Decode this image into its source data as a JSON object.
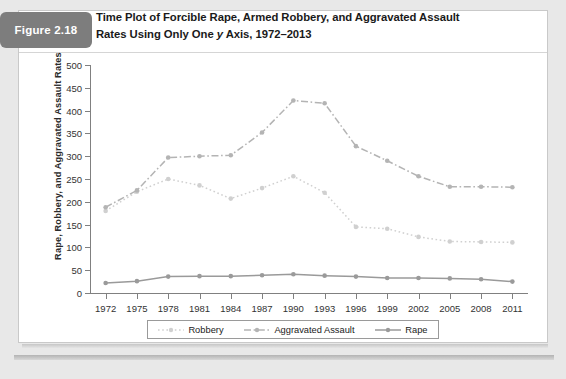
{
  "figure": {
    "badge_label": "Figure 2.18",
    "title_line1": "Time Plot of Forcible Rape, Armed Robbery, and Aggravated Assault",
    "title_line2_a": "Rates Using Only One ",
    "title_line2_italic": "y",
    "title_line2_b": " Axis, 1972–2013"
  },
  "colors": {
    "badge_bg": "#7d7d7d",
    "card_bg": "#ffffff",
    "page_bg": "#e8e8e8",
    "axis": "#808080",
    "robbery": "#d0d0d0",
    "aggravated_assault": "#b4b4b4",
    "rape": "#9a9a9a"
  },
  "chart_data": {
    "type": "line",
    "title": "Time Plot of Forcible Rape, Armed Robbery, and Aggravated Assault Rates Using Only One y Axis, 1972–2013",
    "xlabel": "",
    "ylabel": "Rape, Robbery, and Aggravated Assault Rates",
    "x": [
      1972,
      1975,
      1978,
      1981,
      1984,
      1987,
      1990,
      1993,
      1996,
      1999,
      2002,
      2005,
      2008,
      2011
    ],
    "xtick_labels": [
      "1972",
      "1975",
      "1978",
      "1981",
      "1984",
      "1987",
      "1990",
      "1993",
      "1996",
      "1999",
      "2002",
      "2005",
      "2008",
      "2011"
    ],
    "ytick_labels": [
      "0",
      "50",
      "100",
      "150",
      "200",
      "250",
      "300",
      "350",
      "400",
      "450",
      "500"
    ],
    "yticks": [
      0,
      50,
      100,
      150,
      200,
      250,
      300,
      350,
      400,
      450,
      500
    ],
    "ylim": [
      0,
      500
    ],
    "xlim": [
      1970.5,
      2012.5
    ],
    "grid": false,
    "legend_position": "bottom",
    "series": [
      {
        "name": "Robbery",
        "style": "dotted",
        "color": "#d0d0d0",
        "values": [
          180,
          222,
          250,
          236,
          207,
          230,
          256,
          220,
          145,
          141,
          123,
          113,
          112,
          111
        ]
      },
      {
        "name": "Aggravated Assault",
        "style": "dash-dot",
        "color": "#b4b4b4",
        "values": [
          188,
          225,
          297,
          300,
          302,
          352,
          422,
          416,
          322,
          290,
          256,
          233,
          233,
          232
        ]
      },
      {
        "name": "Rape",
        "style": "solid",
        "color": "#9a9a9a",
        "values": [
          22,
          26,
          36,
          37,
          37,
          39,
          41,
          38,
          36,
          33,
          33,
          32,
          30,
          25
        ]
      }
    ]
  },
  "legend": {
    "items": [
      {
        "label": "Robbery"
      },
      {
        "label": "Aggravated Assault"
      },
      {
        "label": "Rape"
      }
    ]
  }
}
